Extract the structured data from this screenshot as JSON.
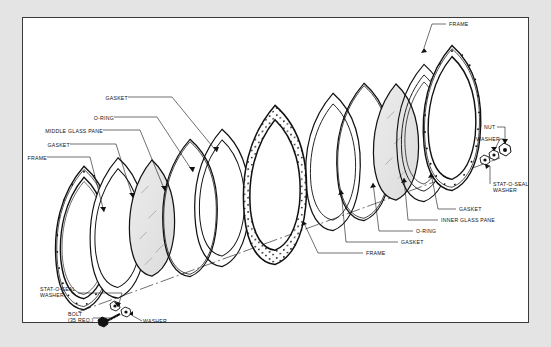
{
  "diagram": {
    "type": "exploded-assembly-drawing",
    "sheet_border": true,
    "background_color": "#e4e4e4",
    "sheet_color": "#ffffff",
    "line_color": "#111111",
    "glass_fill_color": "#e6e6e6",
    "gasket_stipple": true
  },
  "labels_left": [
    {
      "id": "gasket-top",
      "text": "GASKET",
      "x": 97,
      "y": 98
    },
    {
      "id": "o-ring-left",
      "text": "O-RING",
      "x": 90,
      "y": 118
    },
    {
      "id": "middle-glass-pane",
      "text": "MIDDLE GLASS PANE",
      "x": 31,
      "y": 131
    },
    {
      "id": "gasket-left",
      "text": "GASKET",
      "x": 44,
      "y": 145
    },
    {
      "id": "frame-left",
      "text": "FRAME",
      "x": 20,
      "y": 158
    },
    {
      "id": "stat-o-seal-left",
      "text": "STAT-O-SEAL\nWASHER",
      "x": 44,
      "y": 288
    },
    {
      "id": "bolt",
      "text": "BOLT\n(35 REQ.)",
      "x": 71,
      "y": 315
    },
    {
      "id": "washer-bottom",
      "text": "WASHER",
      "x": 144,
      "y": 321
    }
  ],
  "labels_right": [
    {
      "id": "frame-top-right",
      "text": "FRAME",
      "x": 448,
      "y": 17
    },
    {
      "id": "nut",
      "text": "NUT",
      "x": 493,
      "y": 121
    },
    {
      "id": "washer-right",
      "text": "WASHER",
      "x": 479,
      "y": 134
    },
    {
      "id": "stat-o-seal-right",
      "text": "STAT-O-SEAL\nWASHER",
      "x": 492,
      "y": 185
    },
    {
      "id": "gasket-right-upper",
      "text": "GASKET",
      "x": 458,
      "y": 208
    },
    {
      "id": "inner-glass-pane",
      "text": "INNER GLASS PANE",
      "x": 440,
      "y": 219
    },
    {
      "id": "o-ring-right",
      "text": "O-RING",
      "x": 415,
      "y": 230
    },
    {
      "id": "gasket-right-lower",
      "text": "GASKET",
      "x": 400,
      "y": 241
    },
    {
      "id": "frame-bottom",
      "text": "FRAME",
      "x": 365,
      "y": 252
    }
  ],
  "components": [
    {
      "name": "FRAME",
      "count": 2
    },
    {
      "name": "GASKET",
      "count": 4
    },
    {
      "name": "O-RING",
      "count": 2
    },
    {
      "name": "MIDDLE GLASS PANE",
      "count": 1
    },
    {
      "name": "INNER GLASS PANE",
      "count": 1
    },
    {
      "name": "STAT-O-SEAL WASHER",
      "count": 2
    },
    {
      "name": "BOLT (35 REQ.)",
      "count": 35
    },
    {
      "name": "WASHER",
      "count": 2
    },
    {
      "name": "NUT",
      "count": 1
    }
  ]
}
